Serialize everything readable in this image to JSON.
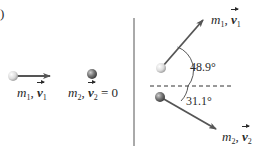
{
  "figure": {
    "part_label": ")",
    "before": {
      "mass1": {
        "symbol": "m",
        "sub": "1",
        "velocity_symbol": "v",
        "velocity_sub": "1",
        "separator": ",",
        "suffix": ""
      },
      "mass2": {
        "symbol": "m",
        "sub": "2",
        "velocity_symbol": "v",
        "velocity_sub": "2",
        "separator": ",",
        "suffix": "= 0"
      }
    },
    "after": {
      "mass1": {
        "symbol": "m",
        "sub": "1",
        "velocity_symbol": "v",
        "velocity_sub": "1",
        "prime": "′",
        "separator": ","
      },
      "mass2": {
        "symbol": "m",
        "sub": "2",
        "velocity_symbol": "v",
        "velocity_sub": "2",
        "prime": "′",
        "separator": ","
      },
      "angle1": "48.9°",
      "angle2": "31.1°"
    },
    "colors": {
      "arrow": "#555555",
      "divider": "#555555",
      "dashed": "#333333",
      "ball_light": "#e8e8e8",
      "ball_dark": "#6a6a6a"
    }
  }
}
